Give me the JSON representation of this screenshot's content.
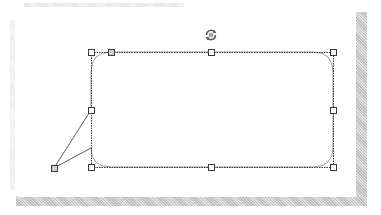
{
  "canvas": {
    "background": "#ffffff",
    "paper_color": "#ffffff",
    "shadow_color": "#bdbdbd"
  },
  "shape": {
    "type": "rounded-rectangle-callout",
    "selected": true,
    "outline_style": "dashed",
    "outline_color": "#3a3a3a",
    "bounds": {
      "left": 91,
      "top": 52,
      "right": 333,
      "bottom": 167
    },
    "corner_radius": 20,
    "tail": {
      "tip": {
        "x": 54,
        "y": 168
      },
      "base_start": {
        "x": 91,
        "y": 110
      },
      "base_end": {
        "x": 91,
        "y": 148
      }
    }
  },
  "handles": {
    "resize": [
      {
        "name": "top-left",
        "x": 91,
        "y": 52
      },
      {
        "name": "top-center",
        "x": 211,
        "y": 52
      },
      {
        "name": "top-right",
        "x": 333,
        "y": 52
      },
      {
        "name": "middle-left",
        "x": 91,
        "y": 110
      },
      {
        "name": "middle-right",
        "x": 333,
        "y": 110
      },
      {
        "name": "bottom-left",
        "x": 91,
        "y": 167
      },
      {
        "name": "bottom-center",
        "x": 211,
        "y": 167
      },
      {
        "name": "bottom-right",
        "x": 333,
        "y": 167
      }
    ],
    "adjust": [
      {
        "name": "corner-radius",
        "x": 111,
        "y": 52
      },
      {
        "name": "tail-tip",
        "x": 54,
        "y": 168
      }
    ],
    "rotate": {
      "name": "rotation-handle",
      "x": 211,
      "y": 35,
      "icon": "rotate-icon"
    }
  }
}
